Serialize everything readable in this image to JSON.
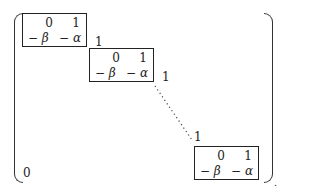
{
  "matrix": {
    "description": "Block companion matrix with 2x2 blocks along the diagonal",
    "blocks": [
      {
        "r0": [
          "0",
          "1"
        ],
        "r1": [
          "− β",
          "− α"
        ]
      },
      {
        "r0": [
          "0",
          "1"
        ],
        "r1": [
          "− β",
          "− α"
        ]
      },
      {
        "r0": [
          "0",
          "1"
        ],
        "r1": [
          "− β",
          "− α"
        ]
      }
    ],
    "superdiagonal_labels": [
      "1",
      "1",
      "1"
    ],
    "lower_left_label": "0",
    "trailing_mark": "."
  }
}
